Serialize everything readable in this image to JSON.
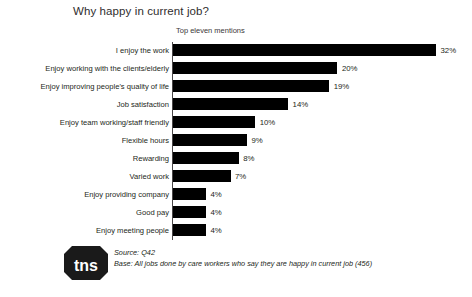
{
  "chart_data": {
    "type": "bar",
    "orientation": "horizontal",
    "title": "Why happy in current job?",
    "subtitle": "Top eleven mentions",
    "xlabel": "",
    "ylabel": "",
    "xlim": [
      0,
      35
    ],
    "grid": false,
    "legend": null,
    "bar_color": "#000000",
    "value_suffix": "%",
    "categories": [
      "I enjoy the work",
      "Enjoy working with the clients/elderly",
      "Enjoy improving people's quality of life",
      "Job satisfaction",
      "Enjoy team working/staff friendly",
      "Flexible hours",
      "Rewarding",
      "Varied work",
      "Enjoy providing company",
      "Good pay",
      "Enjoy meeting people"
    ],
    "values": [
      32,
      20,
      19,
      14,
      10,
      9,
      8,
      7,
      4,
      4,
      4
    ],
    "value_labels": [
      "32%",
      "20%",
      "19%",
      "14%",
      "10%",
      "9%",
      "8%",
      "7%",
      "4%",
      "4%",
      "4%"
    ],
    "annotations": [
      "Source: Q42",
      "Base: All jobs done by care workers who say they are happy in current job (456)"
    ]
  },
  "footer": {
    "logo_text": "tns",
    "logo_trademark": "®",
    "source_line": "Source: Q42",
    "base_line": "Base: All jobs done by care workers who say they are happy in current job (456)"
  }
}
